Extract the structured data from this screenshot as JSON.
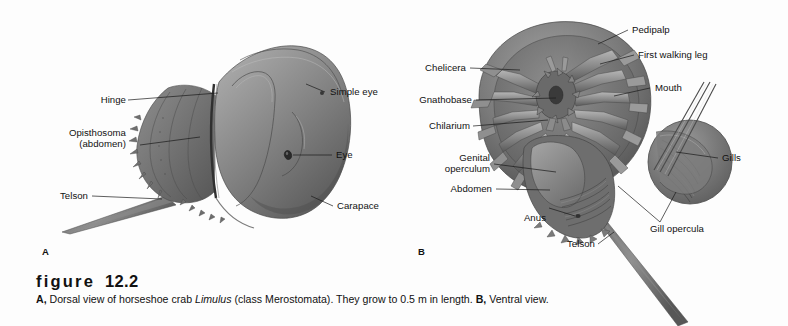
{
  "figure": {
    "number_label": "figure",
    "number": "12.2",
    "caption_parts": {
      "a_mark": "A,",
      "a_text_1": " Dorsal view of horseshoe crab ",
      "a_species": "Limulus",
      "a_text_2": " (class Merostomata). They grow to 0.5 m in length. ",
      "b_mark": "B,",
      "b_text": " Ventral view."
    },
    "caption_full": "A, Dorsal view of horseshoe crab Limulus (class Merostomata). They grow to 0.5 m in length. B, Ventral view."
  },
  "panel_a": {
    "marker": "A",
    "view": "Dorsal view",
    "labels": [
      {
        "id": "hinge",
        "text": "Hinge",
        "align": "right"
      },
      {
        "id": "opisthosoma",
        "text": "Opisthosoma\n(abdomen)",
        "align": "right"
      },
      {
        "id": "telson",
        "text": "Telson",
        "align": "right"
      },
      {
        "id": "simple-eye",
        "text": "Simple eye",
        "align": "left"
      },
      {
        "id": "eye",
        "text": "Eye",
        "align": "left"
      },
      {
        "id": "carapace",
        "text": "Carapace",
        "align": "left"
      }
    ]
  },
  "panel_b": {
    "marker": "B",
    "view": "Ventral view",
    "labels": [
      {
        "id": "chelicera",
        "text": "Chelicera",
        "align": "right"
      },
      {
        "id": "gnathobase",
        "text": "Gnathobase",
        "align": "right"
      },
      {
        "id": "chilarium",
        "text": "Chilarium",
        "align": "right"
      },
      {
        "id": "genital-operculum",
        "text": "Genital\noperculum",
        "align": "right"
      },
      {
        "id": "abdomen",
        "text": "Abdomen",
        "align": "right"
      },
      {
        "id": "anus",
        "text": "Anus",
        "align": "right"
      },
      {
        "id": "telson",
        "text": "Telson",
        "align": "right"
      },
      {
        "id": "pedipalp",
        "text": "Pedipalp",
        "align": "left"
      },
      {
        "id": "first-walking-leg",
        "text": "First walking leg",
        "align": "left"
      },
      {
        "id": "mouth",
        "text": "Mouth",
        "align": "left"
      },
      {
        "id": "gills",
        "text": "Gills",
        "align": "left"
      },
      {
        "id": "gill-opercula",
        "text": "Gill opercula",
        "align": "center"
      }
    ]
  },
  "colors": {
    "background": "#fdfdfd",
    "ink": "#111111",
    "shell_dark": "#5d5d5d",
    "shell_mid": "#7d7d7d",
    "shell_light": "#9a9a9a",
    "shell_hilite": "#b4b4b4",
    "shadow": "#3f3f3f"
  }
}
